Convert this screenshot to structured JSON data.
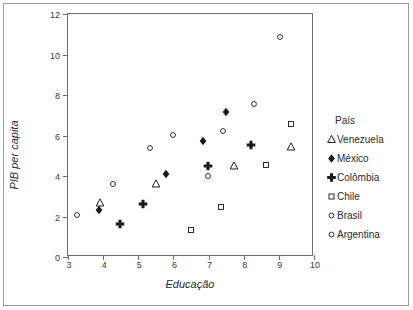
{
  "chart_data": {
    "type": "scatter",
    "title": "",
    "xlabel": "Educação",
    "ylabel": "PIB per capita",
    "xlim": [
      3,
      10
    ],
    "ylim": [
      0,
      12
    ],
    "xticks": [
      "3",
      "4",
      "5",
      "6",
      "7",
      "8",
      "9",
      "10"
    ],
    "yticks": [
      "0",
      "2",
      "4",
      "6",
      "8",
      "10",
      "12"
    ],
    "grid": false,
    "legend_position": "right",
    "legend_title": "País",
    "series": [
      {
        "name": "Venezuela",
        "marker": "open-triangle",
        "points": [
          {
            "x": 3.9,
            "y": 2.68
          },
          {
            "x": 5.5,
            "y": 3.6
          },
          {
            "x": 7.72,
            "y": 4.48
          },
          {
            "x": 9.35,
            "y": 5.45
          }
        ]
      },
      {
        "name": "México",
        "marker": "filled-diamond",
        "points": [
          {
            "x": 3.87,
            "y": 2.3
          },
          {
            "x": 5.78,
            "y": 4.12
          },
          {
            "x": 6.85,
            "y": 5.75
          },
          {
            "x": 7.5,
            "y": 7.18
          }
        ]
      },
      {
        "name": "Colômbia",
        "marker": "filled-plus",
        "points": [
          {
            "x": 4.47,
            "y": 1.62
          },
          {
            "x": 5.12,
            "y": 2.62
          },
          {
            "x": 6.97,
            "y": 4.48
          },
          {
            "x": 8.22,
            "y": 5.52
          }
        ]
      },
      {
        "name": "Chile",
        "marker": "open-square",
        "points": [
          {
            "x": 6.5,
            "y": 1.35
          },
          {
            "x": 7.35,
            "y": 2.48
          },
          {
            "x": 8.62,
            "y": 4.55
          },
          {
            "x": 9.35,
            "y": 6.55
          }
        ]
      },
      {
        "name": "Brasil",
        "marker": "open-circle",
        "points": [
          {
            "x": 4.28,
            "y": 3.6
          },
          {
            "x": 5.33,
            "y": 5.38
          },
          {
            "x": 6.0,
            "y": 6.02
          },
          {
            "x": 7.4,
            "y": 6.22
          },
          {
            "x": 8.28,
            "y": 7.58
          }
        ]
      },
      {
        "name": "Argentina",
        "marker": "open-circle",
        "points": [
          {
            "x": 3.25,
            "y": 2.05
          },
          {
            "x": 6.97,
            "y": 3.98
          },
          {
            "x": 9.02,
            "y": 10.85
          }
        ]
      }
    ]
  },
  "legend": {
    "title": "País",
    "items": [
      {
        "label": "Venezuela",
        "marker": "open-triangle"
      },
      {
        "label": "México",
        "marker": "filled-diamond"
      },
      {
        "label": "Colômbia",
        "marker": "filled-plus"
      },
      {
        "label": "Chile",
        "marker": "open-square"
      },
      {
        "label": "Brasil",
        "marker": "open-circle"
      },
      {
        "label": "Argentina",
        "marker": "open-circle"
      }
    ]
  },
  "colors": {
    "marker": "#1a1a1a",
    "axis": "#6e6e6e",
    "frame": "#9a9a9a",
    "text": "#2b2b2b",
    "background": "#ffffff"
  }
}
